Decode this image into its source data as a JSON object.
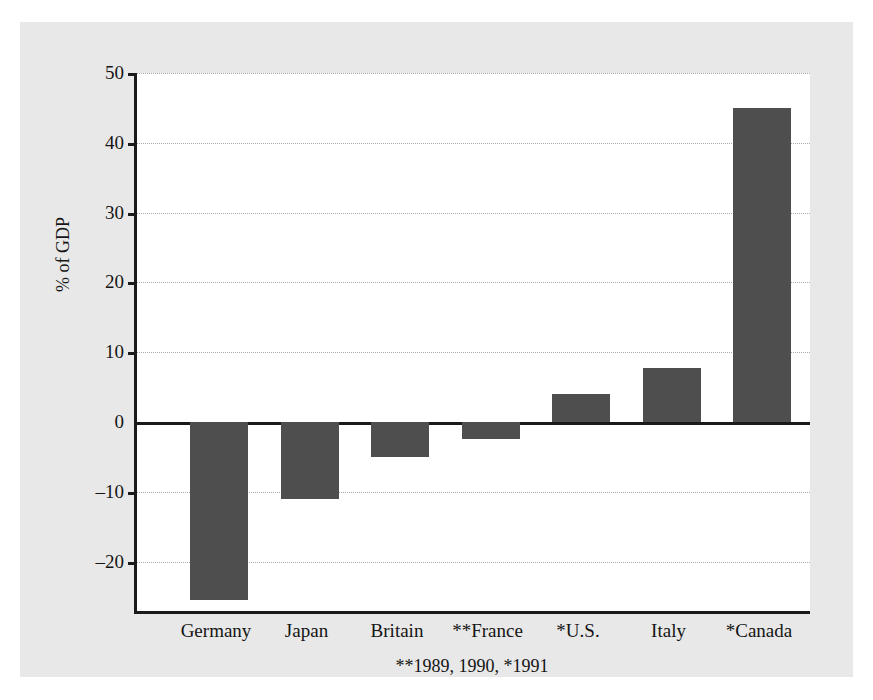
{
  "figure": {
    "cutoff_caption": "",
    "footnote": "**1989, 1990, *1991"
  },
  "chart_data": {
    "type": "bar",
    "title": "",
    "xlabel": "",
    "ylabel": "% of GDP",
    "categories": [
      "Germany",
      "Japan",
      "Britain",
      "**France",
      "*U.S.",
      "Italy",
      "*Canada"
    ],
    "values": [
      -25.5,
      -11.0,
      -5.0,
      -2.5,
      4.0,
      7.7,
      45.0
    ],
    "ylim": [
      -27.5,
      50
    ],
    "yticks": [
      50,
      40,
      30,
      20,
      10,
      0,
      -10,
      -20
    ],
    "ytick_labels": [
      "50",
      "40",
      "30",
      "20",
      "10",
      "0",
      "–10",
      "–20"
    ],
    "grid": true,
    "grid_style": "dotted-horizontal",
    "zero_line": true,
    "legend": null,
    "bar_color": "#4e4e4e",
    "axis_color": "#1a1a1a",
    "gridline_color": "#aaaaaa",
    "panel_background": "#e8e8e8",
    "plot_background": "#ffffff",
    "footnote": "**1989, 1990, *1991"
  }
}
